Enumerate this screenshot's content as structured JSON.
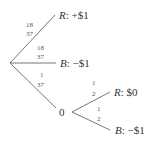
{
  "diagram": {
    "type": "probability-tree",
    "root": {
      "branches": [
        {
          "probability": {
            "numerator": "18",
            "denominator": "37"
          },
          "outcome": "R",
          "payoff": "+$1"
        },
        {
          "probability": {
            "numerator": "18",
            "denominator": "37"
          },
          "outcome": "B",
          "payoff": "−$1"
        },
        {
          "probability": {
            "numerator": "1",
            "denominator": "37"
          },
          "node_label": "0",
          "branches": [
            {
              "probability": {
                "numerator": "1",
                "denominator": "2"
              },
              "outcome": "R",
              "payoff": "$0"
            },
            {
              "probability": {
                "numerator": "1",
                "denominator": "2"
              },
              "outcome": "B",
              "payoff": "−$1"
            }
          ]
        }
      ]
    },
    "line_color": "#666666",
    "text_color": "#333333"
  }
}
